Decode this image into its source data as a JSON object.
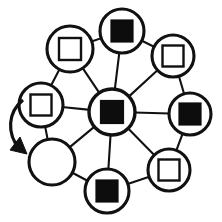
{
  "diagram": {
    "type": "node-link-diagram",
    "background_color": "#ffffff",
    "stroke_color": "#111111",
    "fill_color": "#0d0d0d",
    "center_node": {
      "id": "center",
      "label": "center-node",
      "cx": 112,
      "cy": 112,
      "r": 23,
      "marker": "filled-square",
      "marker_size": 23
    },
    "outer_nodes": [
      {
        "id": "n1",
        "label": "node-top",
        "cx": 122,
        "cy": 31,
        "r": 22,
        "marker": "filled-square",
        "marker_size": 22
      },
      {
        "id": "n2",
        "label": "node-top-right",
        "cx": 173,
        "cy": 56,
        "r": 21,
        "marker": "hollow-square",
        "marker_size": 21
      },
      {
        "id": "n3",
        "label": "node-right",
        "cx": 190,
        "cy": 114,
        "r": 21,
        "marker": "filled-square",
        "marker_size": 22
      },
      {
        "id": "n4",
        "label": "node-bottom-right",
        "cx": 169,
        "cy": 170,
        "r": 21,
        "marker": "hollow-square",
        "marker_size": 21
      },
      {
        "id": "n5",
        "label": "node-bottom",
        "cx": 107,
        "cy": 191,
        "r": 22,
        "marker": "filled-square",
        "marker_size": 22
      },
      {
        "id": "n6",
        "label": "node-bottom-left",
        "cx": 52,
        "cy": 162,
        "r": 23,
        "marker": "empty",
        "marker_size": 0
      },
      {
        "id": "n7",
        "label": "node-left",
        "cx": 41,
        "cy": 105,
        "r": 22,
        "marker": "hollow-square",
        "marker_size": 21
      },
      {
        "id": "n8",
        "label": "node-top-left",
        "cx": 70,
        "cy": 49,
        "r": 23,
        "marker": "hollow-square",
        "marker_size": 22
      }
    ],
    "ring_edges": [
      {
        "from": "n1",
        "to": "n2"
      },
      {
        "from": "n2",
        "to": "n3"
      },
      {
        "from": "n3",
        "to": "n4"
      },
      {
        "from": "n4",
        "to": "n5"
      },
      {
        "from": "n5",
        "to": "n6"
      },
      {
        "from": "n6",
        "to": "n7"
      },
      {
        "from": "n7",
        "to": "n8"
      },
      {
        "from": "n8",
        "to": "n1"
      }
    ],
    "spoke_edges": [
      {
        "from": "center",
        "to": "n1"
      },
      {
        "from": "center",
        "to": "n2"
      },
      {
        "from": "center",
        "to": "n3"
      },
      {
        "from": "center",
        "to": "n4"
      },
      {
        "from": "center",
        "to": "n5"
      },
      {
        "from": "center",
        "to": "n6"
      },
      {
        "from": "center",
        "to": "n7"
      },
      {
        "from": "center",
        "to": "n8"
      }
    ],
    "rotation_arrow": {
      "label": "rotation-direction-arrow",
      "direction": "clockwise-downward",
      "path": "M 23 100 C 8 112, 6 133, 20 150",
      "head_points": "20,137 27,154 10,150"
    },
    "legend": {
      "filled_square_meaning": "filled-node",
      "hollow_square_meaning": "hollow-node",
      "empty_circle_meaning": "empty-node"
    }
  }
}
